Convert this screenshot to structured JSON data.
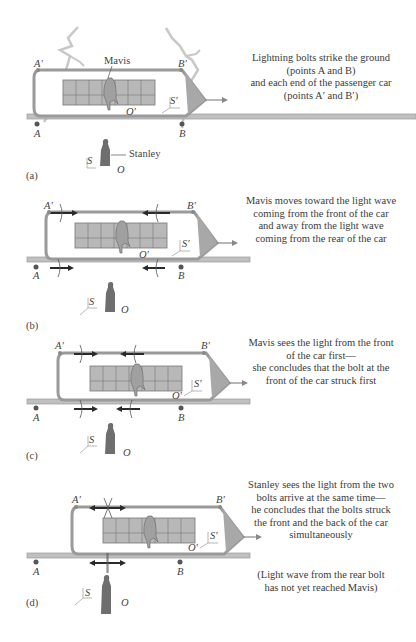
{
  "figure": {
    "panels": [
      {
        "id": "a",
        "tag": "(a)",
        "caption": [
          "Lightning bolts strike the ground",
          "(points A and B)",
          "and each end of the passenger car",
          "(points A′ and B′)"
        ],
        "labels": {
          "a_prime": "A′",
          "b_prime": "B′",
          "a": "A",
          "b": "B",
          "o_prime": "O′",
          "s_prime": "S′",
          "s": "S",
          "o": "O",
          "mavis": "Mavis",
          "stanley": "Stanley"
        }
      },
      {
        "id": "b",
        "tag": "(b)",
        "caption": [
          "Mavis moves toward the light wave",
          "coming from the front of the car",
          "and away from the light wave",
          "coming from the rear of the car"
        ],
        "labels": {
          "a_prime": "A′",
          "b_prime": "B′",
          "a": "A",
          "b": "B",
          "o_prime": "O′",
          "s_prime": "S′",
          "s": "S",
          "o": "O"
        }
      },
      {
        "id": "c",
        "tag": "(c)",
        "caption": [
          "Mavis sees the light from the front",
          "of the car first—",
          "she concludes that the bolt at the",
          "front of the car struck first"
        ],
        "labels": {
          "a_prime": "A′",
          "b_prime": "B′",
          "a": "A",
          "b": "B",
          "o_prime": "O′",
          "s_prime": "S′",
          "s": "S",
          "o": "O"
        }
      },
      {
        "id": "d",
        "tag": "(d)",
        "caption": [
          "Stanley sees the light from the two",
          "bolts arrive at the same time—",
          "he concludes that the bolts struck",
          "the front and the back of the car",
          "simultaneously"
        ],
        "note": [
          "(Light wave from the rear bolt",
          "has not yet reached Mavis)"
        ],
        "labels": {
          "a_prime": "A′",
          "b_prime": "B′",
          "a": "A",
          "b": "B",
          "o_prime": "O′",
          "s_prime": "S′",
          "s": "S",
          "o": "O"
        }
      }
    ],
    "colors": {
      "car_outline": "#9a9a9a",
      "car_nose": "#a8a8a8",
      "seat_fill": "#b8b8b8",
      "figure_fill": "#6e6e6e",
      "mavis_fill": "#a0a0a0",
      "lightning": "#c4c4c4",
      "wave_arrow": "#2a2a2a",
      "text": "#3a3a3a"
    }
  }
}
